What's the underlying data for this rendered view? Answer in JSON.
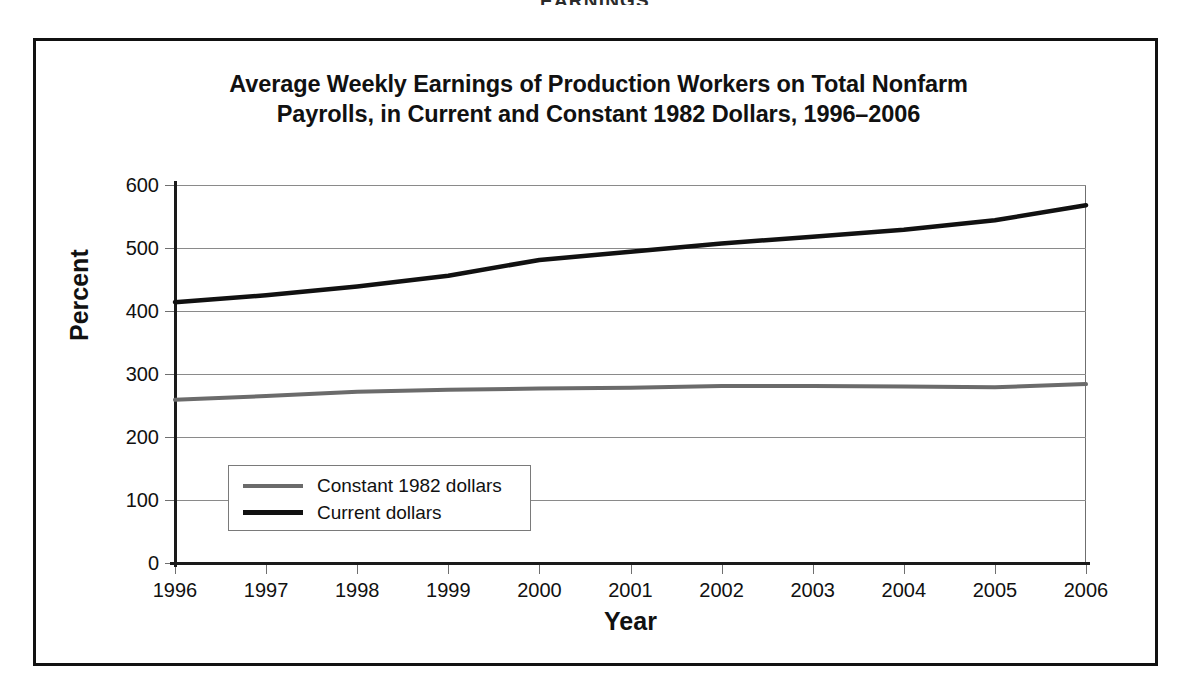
{
  "running_header": "EARNINGS",
  "figure": {
    "title_line1": "Average Weekly Earnings of Production Workers on Total Nonfarm",
    "title_line2": "Payrolls, in Current and Constant 1982 Dollars, 1996–2006"
  },
  "colors": {
    "current_dollars": "#111111",
    "constant_dollars": "#6b6b6b",
    "gridline": "#8a8a8a",
    "axis": "#1a1a1a",
    "frame": "#111111",
    "background": "#ffffff"
  },
  "chart_data": {
    "type": "line",
    "title": "Average Weekly Earnings of Production Workers on Total Nonfarm Payrolls, in Current and Constant 1982 Dollars, 1996–2006",
    "xlabel": "Year",
    "ylabel": "Percent",
    "x": [
      1996,
      1997,
      1998,
      1999,
      2000,
      2001,
      2002,
      2003,
      2004,
      2005,
      2006
    ],
    "categories": [
      "1996",
      "1997",
      "1998",
      "1999",
      "2000",
      "2001",
      "2002",
      "2003",
      "2004",
      "2005",
      "2006"
    ],
    "xlim": [
      1996,
      2006
    ],
    "ylim": [
      0,
      600
    ],
    "yticks": [
      0,
      100,
      200,
      300,
      400,
      500,
      600
    ],
    "ytick_labels": [
      "0",
      "100",
      "200",
      "300",
      "400",
      "500",
      "600"
    ],
    "grid": true,
    "grid_axis": "y",
    "legend_position": "lower left (inside plot)",
    "series": [
      {
        "name": "Constant 1982 dollars",
        "color": "#6b6b6b",
        "values": [
          259,
          265,
          272,
          275,
          277,
          278,
          281,
          281,
          280,
          279,
          284
        ]
      },
      {
        "name": "Current dollars",
        "color": "#111111",
        "values": [
          414,
          425,
          439,
          456,
          481,
          494,
          507,
          518,
          529,
          544,
          568
        ]
      }
    ]
  },
  "legend": {
    "items": [
      {
        "label": "Constant 1982 dollars",
        "series": "constant_dollars"
      },
      {
        "label": "Current dollars",
        "series": "current_dollars"
      }
    ]
  }
}
